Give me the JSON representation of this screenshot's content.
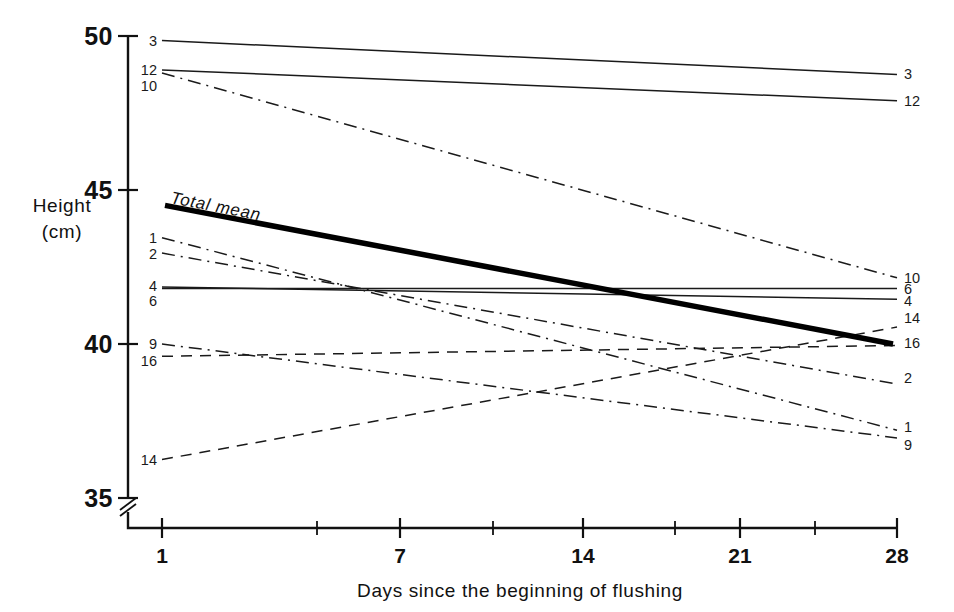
{
  "chart_data": {
    "type": "line",
    "title": "",
    "xlabel": "Days since the beginning of  flushing",
    "ylabel_line1": "Height",
    "ylabel_line2": "(cm)",
    "x": [
      1,
      28
    ],
    "xlim": [
      1,
      28
    ],
    "ylim": [
      35,
      50
    ],
    "xticks": [
      1,
      7,
      14,
      21,
      28
    ],
    "xtick_labels": [
      "1",
      "7",
      "14",
      "21",
      "28"
    ],
    "x_minor_ticks": [
      4,
      10,
      17,
      24
    ],
    "yticks": [
      35,
      40,
      45,
      50
    ],
    "ytick_labels": [
      "35",
      "40",
      "45",
      "50"
    ],
    "grid": false,
    "legend": "inline-endpoint-labels",
    "axis_break": true,
    "axis_break_note": "y-axis broken below 35",
    "series": [
      {
        "name": "3",
        "label_left": "3",
        "label_right": "3",
        "style": "solid",
        "values": [
          49.85,
          48.75
        ]
      },
      {
        "name": "12",
        "label_left": "12",
        "label_right": "12",
        "style": "solid",
        "values": [
          48.9,
          47.9
        ]
      },
      {
        "name": "10",
        "label_left": "10",
        "label_right": "10",
        "style": "dashdot",
        "values": [
          48.8,
          42.15
        ]
      },
      {
        "name": "1",
        "label_left": "1",
        "label_right": "1",
        "style": "dashdot",
        "values": [
          43.45,
          37.2
        ]
      },
      {
        "name": "2",
        "label_left": "2",
        "label_right": "2",
        "style": "dashdot",
        "values": [
          42.95,
          38.7
        ]
      },
      {
        "name": "4",
        "label_left": "4",
        "label_right": "4",
        "style": "solid",
        "values": [
          41.85,
          41.45
        ]
      },
      {
        "name": "6",
        "label_left": "6",
        "label_right": "6",
        "style": "solid",
        "values": [
          41.8,
          41.8
        ]
      },
      {
        "name": "9",
        "label_left": "9",
        "label_right": "9",
        "style": "dashdot",
        "values": [
          40.0,
          36.95
        ]
      },
      {
        "name": "16",
        "label_left": "16",
        "label_right": "16",
        "style": "dashed",
        "values": [
          39.6,
          39.95
        ]
      },
      {
        "name": "14",
        "label_left": "14",
        "label_right": "14",
        "style": "dashed",
        "values": [
          36.25,
          40.55
        ]
      },
      {
        "name": "Total mean",
        "label_left": "",
        "label_right": "",
        "style": "thick",
        "values": [
          44.5,
          40.0
        ]
      }
    ],
    "mean_annotation": "Total mean",
    "colors": {
      "line": "#1a1a1a",
      "mean_line": "#000000",
      "axis": "#111111",
      "background": "#ffffff"
    }
  }
}
